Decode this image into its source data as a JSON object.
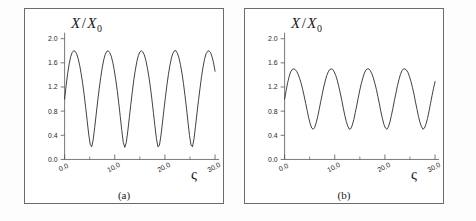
{
  "figure": {
    "background": "#fdfdfd",
    "frame_color": "#6b6b6b",
    "curve_color": "#2b2b2b",
    "axis_color": "#555555"
  },
  "chart_data": [
    {
      "type": "line",
      "panel": "a",
      "caption": "(a)",
      "title": "",
      "ylabel": "X / X_0",
      "ylabel_main": "X",
      "ylabel_slash": "/",
      "ylabel_den": "X",
      "ylabel_sub": "0",
      "xlabel": "ς",
      "xlim": [
        0.0,
        30.0
      ],
      "ylim": [
        0.0,
        2.0
      ],
      "xticks": [
        0.0,
        10.0,
        20.0,
        30.0
      ],
      "xtick_labels": [
        "0.0",
        "10.0",
        "20.0",
        "30.0"
      ],
      "xminor_ticks": [
        5.0,
        15.0,
        25.0
      ],
      "yticks": [
        0.0,
        0.4,
        0.8,
        1.2,
        1.6,
        2.0
      ],
      "ytick_labels": [
        "0.0",
        "0.4",
        "0.8",
        "1.2",
        "1.6",
        "2.0"
      ],
      "grid": false,
      "legend": "none",
      "y_min_value": 0.2,
      "y_max_value": 1.8,
      "y_start_value": 1.0,
      "period": 6.3,
      "n_oscillations": 5,
      "waveform": "cusped",
      "x": [
        0.0,
        0.3,
        0.6,
        0.9,
        1.2,
        1.5,
        1.8,
        2.1,
        2.4,
        2.7,
        3.0,
        3.3,
        3.6,
        3.9,
        4.2,
        4.5,
        4.8,
        5.1,
        5.4,
        5.7,
        6.0,
        6.3,
        6.6,
        6.9,
        7.2,
        7.5,
        7.8,
        8.1,
        8.4,
        8.7,
        9.0,
        9.3,
        9.6,
        9.9,
        10.2,
        10.5,
        10.8,
        11.1,
        11.4,
        11.7,
        12.0,
        12.3,
        12.6,
        12.9,
        13.2,
        13.5,
        13.8,
        14.1,
        14.4,
        14.7,
        15.0,
        15.3,
        15.6,
        15.9,
        16.2,
        16.5,
        16.8,
        17.1,
        17.4,
        17.7,
        18.0,
        18.3,
        18.6,
        18.9,
        19.2,
        19.5,
        19.8,
        20.1,
        20.4,
        20.7,
        21.0,
        21.3,
        21.6,
        21.9,
        22.2,
        22.5,
        22.8,
        23.1,
        23.4,
        23.7,
        24.0,
        24.3,
        24.6,
        24.9,
        25.2,
        25.5,
        25.8,
        26.1,
        26.4,
        26.7,
        27.0,
        27.3,
        27.6,
        27.9,
        28.2,
        28.5,
        28.8,
        29.1,
        29.4,
        29.7,
        30.0
      ],
      "y": [
        1.0,
        1.22,
        1.42,
        1.58,
        1.7,
        1.77,
        1.8,
        1.79,
        1.75,
        1.67,
        1.56,
        1.42,
        1.26,
        1.07,
        0.86,
        0.64,
        0.42,
        0.25,
        0.21,
        0.33,
        0.53,
        0.75,
        0.97,
        1.17,
        1.36,
        1.52,
        1.65,
        1.74,
        1.79,
        1.8,
        1.77,
        1.71,
        1.61,
        1.48,
        1.32,
        1.14,
        0.93,
        0.71,
        0.48,
        0.28,
        0.2,
        0.28,
        0.47,
        0.69,
        0.91,
        1.12,
        1.32,
        1.48,
        1.62,
        1.72,
        1.78,
        1.8,
        1.78,
        1.73,
        1.64,
        1.52,
        1.37,
        1.2,
        1.0,
        0.78,
        0.56,
        0.35,
        0.21,
        0.23,
        0.39,
        0.6,
        0.82,
        1.03,
        1.23,
        1.41,
        1.56,
        1.68,
        1.76,
        1.8,
        1.8,
        1.76,
        1.68,
        1.57,
        1.43,
        1.26,
        1.06,
        0.85,
        0.62,
        0.4,
        0.24,
        0.21,
        0.34,
        0.55,
        0.77,
        0.98,
        1.18,
        1.37,
        1.53,
        1.66,
        1.75,
        1.79,
        1.8,
        1.77,
        1.7,
        1.6,
        1.46
      ]
    },
    {
      "type": "line",
      "panel": "b",
      "caption": "(b)",
      "title": "",
      "ylabel": "X / X_0",
      "ylabel_main": "X",
      "ylabel_slash": "/",
      "ylabel_den": "X",
      "ylabel_sub": "0",
      "xlabel": "ς",
      "xlim": [
        0.0,
        30.0
      ],
      "ylim": [
        0.0,
        2.0
      ],
      "xticks": [
        0.0,
        10.0,
        20.0,
        30.0
      ],
      "xtick_labels": [
        "0.0",
        "10.0",
        "20.0",
        "30.0"
      ],
      "xminor_ticks": [
        5.0,
        15.0,
        25.0
      ],
      "yticks": [
        0.0,
        0.4,
        0.8,
        1.2,
        1.6,
        2.0
      ],
      "ytick_labels": [
        "0.0",
        "0.4",
        "0.8",
        "1.2",
        "1.6",
        "2.0"
      ],
      "grid": false,
      "legend": "none",
      "y_min_value": 0.5,
      "y_max_value": 1.5,
      "y_start_value": 1.0,
      "period": 6.3,
      "n_oscillations": 5,
      "waveform": "near-sinusoidal",
      "x": [
        0.0,
        0.3,
        0.6,
        0.9,
        1.2,
        1.5,
        1.8,
        2.1,
        2.4,
        2.7,
        3.0,
        3.3,
        3.6,
        3.9,
        4.2,
        4.5,
        4.8,
        5.1,
        5.4,
        5.7,
        6.0,
        6.3,
        6.6,
        6.9,
        7.2,
        7.5,
        7.8,
        8.1,
        8.4,
        8.7,
        9.0,
        9.3,
        9.6,
        9.9,
        10.2,
        10.5,
        10.8,
        11.1,
        11.4,
        11.7,
        12.0,
        12.3,
        12.6,
        12.9,
        13.2,
        13.5,
        13.8,
        14.1,
        14.4,
        14.7,
        15.0,
        15.3,
        15.6,
        15.9,
        16.2,
        16.5,
        16.8,
        17.1,
        17.4,
        17.7,
        18.0,
        18.3,
        18.6,
        18.9,
        19.2,
        19.5,
        19.8,
        20.1,
        20.4,
        20.7,
        21.0,
        21.3,
        21.6,
        21.9,
        22.2,
        22.5,
        22.8,
        23.1,
        23.4,
        23.7,
        24.0,
        24.3,
        24.6,
        24.9,
        25.2,
        25.5,
        25.8,
        26.1,
        26.4,
        26.7,
        27.0,
        27.3,
        27.6,
        27.9,
        28.2,
        28.5,
        28.8,
        29.1,
        29.4,
        29.7,
        30.0
      ],
      "y": [
        1.0,
        1.14,
        1.27,
        1.37,
        1.45,
        1.49,
        1.5,
        1.49,
        1.46,
        1.41,
        1.34,
        1.26,
        1.16,
        1.05,
        0.93,
        0.81,
        0.69,
        0.59,
        0.52,
        0.5,
        0.53,
        0.61,
        0.71,
        0.83,
        0.96,
        1.08,
        1.2,
        1.3,
        1.39,
        1.45,
        1.49,
        1.5,
        1.49,
        1.45,
        1.39,
        1.31,
        1.21,
        1.1,
        0.98,
        0.85,
        0.73,
        0.63,
        0.55,
        0.5,
        0.51,
        0.57,
        0.66,
        0.78,
        0.9,
        1.03,
        1.15,
        1.26,
        1.35,
        1.43,
        1.48,
        1.5,
        1.5,
        1.47,
        1.42,
        1.35,
        1.26,
        1.16,
        1.04,
        0.92,
        0.79,
        0.68,
        0.58,
        0.52,
        0.5,
        0.54,
        0.62,
        0.73,
        0.85,
        0.98,
        1.1,
        1.22,
        1.32,
        1.41,
        1.47,
        1.5,
        1.5,
        1.48,
        1.44,
        1.37,
        1.29,
        1.19,
        1.08,
        0.95,
        0.83,
        0.71,
        0.61,
        0.54,
        0.5,
        0.52,
        0.59,
        0.68,
        0.8,
        0.93,
        1.06,
        1.18,
        1.29
      ]
    }
  ]
}
